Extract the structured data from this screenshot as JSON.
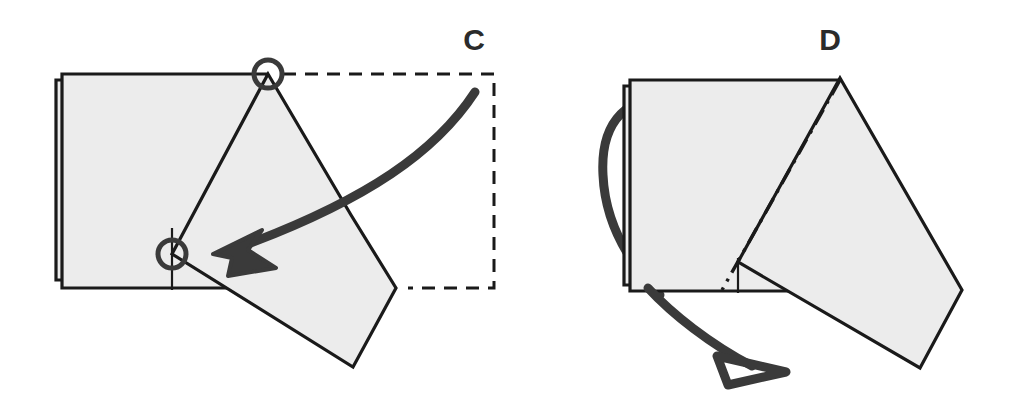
{
  "figure": {
    "type": "origami-instruction-diagram",
    "width": 1017,
    "height": 412,
    "background_color": "#ffffff",
    "paper_fill_color": "#ececec",
    "outline_color": "#1a1a1a",
    "arrow_color": "#3a3a3a",
    "dashed_guide_color": "#1a1a1a"
  },
  "panels": [
    {
      "id": "panel-c",
      "label": "C",
      "label_position": {
        "x": 474,
        "y": 50
      },
      "description": "Folded paper stack with a rotated flap; curved solid arrow points from dashed guide box toward the lower circle marker; two circle markers highlight pivot corners.",
      "paper_stack": {
        "back_sheet": {
          "x": 56,
          "y": 80,
          "width": 205,
          "height": 200
        },
        "front_sheet": {
          "x": 62,
          "y": 74,
          "width": 205,
          "height": 214
        }
      },
      "flap_polygon": [
        {
          "x": 268,
          "y": 74
        },
        {
          "x": 351,
          "y": 215
        },
        {
          "x": 396,
          "y": 288
        },
        {
          "x": 353,
          "y": 367
        },
        {
          "x": 172,
          "y": 254
        }
      ],
      "crease_marks": [
        {
          "x1": 172,
          "y1": 228,
          "x2": 172,
          "y2": 290
        }
      ],
      "circle_markers": [
        {
          "name": "pivot-marker-top",
          "cx": 268,
          "cy": 74,
          "r": 14
        },
        {
          "name": "pivot-marker-bottom",
          "cx": 172,
          "cy": 254,
          "r": 14
        }
      ],
      "dashed_guide_box": {
        "top": {
          "x1": 283,
          "y1": 74,
          "x2": 494,
          "y2": 74
        },
        "right": {
          "x1": 494,
          "y1": 74,
          "x2": 494,
          "y2": 288
        },
        "bottom": {
          "x1": 494,
          "y1": 288,
          "x2": 408,
          "y2": 288
        }
      },
      "motion_arrow": {
        "name": "solid-fold-arrow",
        "style": "solid-filled-head",
        "start": {
          "x": 475,
          "y": 92
        },
        "end": {
          "x": 218,
          "y": 253
        }
      }
    },
    {
      "id": "panel-d",
      "label": "D",
      "label_position": {
        "x": 830,
        "y": 50
      },
      "description": "Resulting shape with diagonal valley-fold dash-dot crease and a hollow-headed turn-over arrow looping around the left edge.",
      "paper_stack": {
        "back_sheet": {
          "x": 624,
          "y": 86,
          "width": 206,
          "height": 199
        },
        "front_sheet": {
          "x": 630,
          "y": 80,
          "width": 210,
          "height": 211
        }
      },
      "flap_polygon": [
        {
          "x": 840,
          "y": 78
        },
        {
          "x": 962,
          "y": 290
        },
        {
          "x": 920,
          "y": 368
        },
        {
          "x": 738,
          "y": 262
        }
      ],
      "fold_crease_dashdot": {
        "x1": 840,
        "y1": 80,
        "x2": 722,
        "y2": 290,
        "pattern": "dash-dot"
      },
      "crease_marks": [
        {
          "x1": 738,
          "y1": 258,
          "x2": 738,
          "y2": 293
        }
      ],
      "motion_arrow": {
        "name": "hollow-turnover-arrow",
        "style": "hollow-outline-head",
        "start": {
          "x": 672,
          "y": 102
        },
        "end": {
          "x": 760,
          "y": 368
        }
      }
    }
  ]
}
